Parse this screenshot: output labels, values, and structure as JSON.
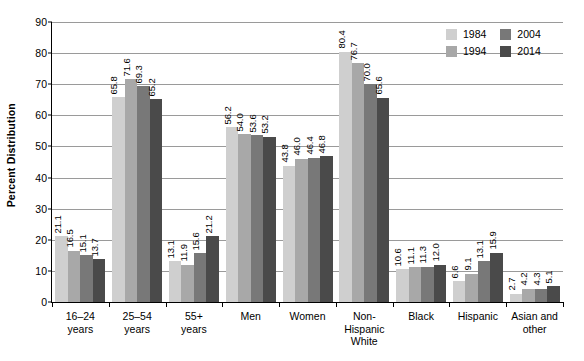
{
  "chart_data": {
    "type": "bar",
    "title": "",
    "xlabel": "",
    "ylabel": "Percent Distribution",
    "ylim": [
      0,
      90
    ],
    "ytick_step": 10,
    "yticks": [
      0,
      10,
      20,
      30,
      40,
      50,
      60,
      70,
      80,
      90
    ],
    "grid": true,
    "legend_position": "top-right",
    "categories": [
      "16–24\nyears",
      "25–54\nyears",
      "55+\nyears",
      "Men",
      "Women",
      "Non-\nHispanic\nWhite",
      "Black",
      "Hispanic",
      "Asian and\nother"
    ],
    "series": [
      {
        "name": "1984",
        "color": "#cfcfcf",
        "values": [
          21.1,
          65.8,
          13.1,
          56.2,
          43.8,
          80.4,
          10.6,
          6.6,
          2.7
        ],
        "labels": [
          "21.1",
          "65.8",
          "13.1",
          "56.2",
          "43.8",
          "80.4",
          "10.6",
          "6.6",
          "2.7"
        ]
      },
      {
        "name": "1994",
        "color": "#a8a8a8",
        "values": [
          16.5,
          71.6,
          11.9,
          54.0,
          46.0,
          76.7,
          11.1,
          9.1,
          4.2
        ],
        "labels": [
          "16.5",
          "71.6",
          "11.9",
          "54.0",
          "46.0",
          "76.7",
          "11.1",
          "9.1",
          "4.2"
        ]
      },
      {
        "name": "2004",
        "color": "#787878",
        "values": [
          15.1,
          69.3,
          15.6,
          53.6,
          46.4,
          70.0,
          11.3,
          13.1,
          4.3
        ],
        "labels": [
          "15.1",
          "69.3",
          "15.6",
          "53.6",
          "46.4",
          "70.0",
          "11.3",
          "13.1",
          "4.3"
        ]
      },
      {
        "name": "2014",
        "color": "#4a4a4a",
        "values": [
          13.7,
          65.2,
          21.2,
          53.2,
          46.8,
          65.6,
          12.0,
          15.9,
          5.1
        ],
        "labels": [
          "13.7",
          "65.2",
          "21.2",
          "53.2",
          "46.8",
          "65.6",
          "12.0",
          "15.9",
          "5.1"
        ]
      }
    ]
  },
  "legend": {
    "entries": [
      {
        "label": "1984",
        "color": "#cfcfcf"
      },
      {
        "label": "2004",
        "color": "#787878"
      },
      {
        "label": "1994",
        "color": "#a8a8a8"
      },
      {
        "label": "2014",
        "color": "#4a4a4a"
      }
    ]
  },
  "axis": {
    "y_title": "Percent Distribution"
  }
}
